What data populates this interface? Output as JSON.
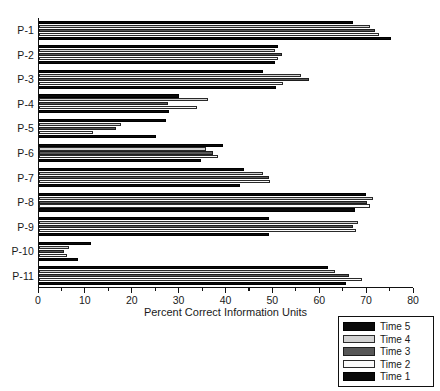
{
  "chart_data": {
    "type": "bar",
    "orientation": "horizontal",
    "title": "",
    "xlabel": "Percent Correct Information Units",
    "ylabel": "",
    "xlim": [
      0,
      80
    ],
    "xticks": [
      0,
      10,
      20,
      30,
      40,
      50,
      60,
      70,
      80
    ],
    "xtick_labels": [
      "0",
      "10",
      "20",
      "30",
      "40",
      "50",
      "60",
      "70",
      "80"
    ],
    "minor_tick_step": 5,
    "grid": false,
    "legend_position": "bottom-right",
    "categories": [
      "P-1",
      "P-2",
      "P-3",
      "P-4",
      "P-5",
      "P-6",
      "P-7",
      "P-8",
      "P-9",
      "P-10",
      "P-11"
    ],
    "series": [
      {
        "name": "Time 5",
        "color": "#0a0a0a",
        "values": [
          67.0,
          51.0,
          47.8,
          29.8,
          27.0,
          39.3,
          43.8,
          69.8,
          49.0,
          11.0,
          61.7
        ]
      },
      {
        "name": "Time 4",
        "color": "#d2d2d2",
        "values": [
          70.6,
          50.3,
          55.9,
          36.0,
          17.4,
          35.7,
          47.8,
          71.3,
          68.1,
          6.3,
          63.2
        ]
      },
      {
        "name": "Time 3",
        "color": "#575757",
        "values": [
          71.7,
          51.9,
          57.5,
          27.5,
          16.5,
          37.2,
          49.0,
          70.0,
          67.0,
          5.3,
          66.2
        ]
      },
      {
        "name": "Time 2",
        "color": "#fbfbfb",
        "values": [
          72.5,
          51.0,
          52.0,
          33.6,
          11.6,
          38.1,
          49.2,
          70.6,
          67.6,
          6.0,
          68.8
        ]
      },
      {
        "name": "Time 1",
        "color": "#0a0a0a",
        "values": [
          75.1,
          50.3,
          50.6,
          27.8,
          25.0,
          34.6,
          42.9,
          67.5,
          49.0,
          8.3,
          65.4
        ]
      }
    ]
  },
  "legend": {
    "entries": [
      {
        "label": "Time 5",
        "swatch": "time5"
      },
      {
        "label": "Time 4",
        "swatch": "time4"
      },
      {
        "label": "Time 3",
        "swatch": "time3"
      },
      {
        "label": "Time 2",
        "swatch": "time2"
      },
      {
        "label": "Time 1",
        "swatch": "time1"
      }
    ]
  },
  "caption": ""
}
